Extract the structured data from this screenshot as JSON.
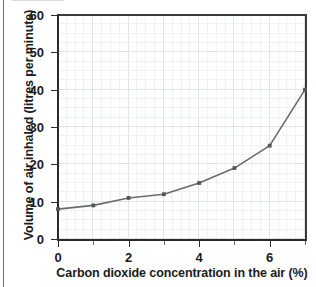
{
  "figure": {
    "background_color": "#ffffff",
    "axis_color": "#2b2b2b",
    "grid_major_color": "#dfe3ea",
    "grid_minor_color": "#eef1f6",
    "series_color": "#6b6b6b",
    "marker_color": "#555555"
  },
  "chart_data": {
    "type": "line",
    "title": "",
    "subtitle": "",
    "xlabel": "Carbon dioxide concentration in the air (%)",
    "ylabel": "Volume of air inhaled (litres per minute)",
    "xlim": [
      0,
      7
    ],
    "ylim": [
      0,
      60
    ],
    "x_tick_labels": [
      "0",
      "2",
      "4",
      "6"
    ],
    "x_tick_values": [
      0,
      2,
      4,
      6
    ],
    "x_minor_tick_values": [
      1,
      3,
      5,
      7
    ],
    "y_tick_labels": [
      "0",
      "10",
      "20",
      "30",
      "40",
      "50",
      "60"
    ],
    "y_tick_values": [
      0,
      10,
      20,
      30,
      40,
      50,
      60
    ],
    "grid": true,
    "grid_minor": true,
    "legend": false,
    "legend_position": "none",
    "markers": true,
    "annotations": [],
    "x": [
      0,
      1,
      2,
      3,
      4,
      5,
      6,
      7
    ],
    "values": [
      8,
      9,
      11,
      12,
      15,
      19,
      25,
      40
    ],
    "series": [
      {
        "name": "Volume of air inhaled",
        "x": [
          0,
          1,
          2,
          3,
          4,
          5,
          6,
          7
        ],
        "values": [
          8,
          9,
          11,
          12,
          15,
          19,
          25,
          40
        ]
      }
    ]
  }
}
